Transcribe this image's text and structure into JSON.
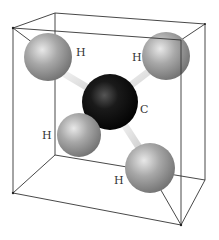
{
  "diagram": {
    "type": "molecular-structure",
    "molecule": "methane",
    "colors": {
      "hydrogen": "#9a9a9a",
      "carbon": "#111111",
      "bond": "#e6e6e6",
      "edge": "#333333",
      "background": "#ffffff"
    },
    "atoms": [
      {
        "id": "h1",
        "element": "H",
        "label": "H",
        "cx": 48,
        "cy": 57,
        "r": 24,
        "label_x": 76,
        "label_y": 56
      },
      {
        "id": "h2",
        "element": "H",
        "label": "H",
        "cx": 166,
        "cy": 56,
        "r": 24,
        "label_x": 132,
        "label_y": 61
      },
      {
        "id": "h3",
        "element": "H",
        "label": "H",
        "cx": 79,
        "cy": 135,
        "r": 22,
        "label_x": 42,
        "label_y": 139
      },
      {
        "id": "h4",
        "element": "H",
        "label": "H",
        "cx": 150,
        "cy": 168,
        "r": 25,
        "label_x": 114,
        "label_y": 184
      },
      {
        "id": "c",
        "element": "C",
        "label": "C",
        "cx": 110,
        "cy": 102,
        "r": 28,
        "label_x": 140,
        "label_y": 113
      }
    ],
    "labels": {
      "h1": "H",
      "h2": "H",
      "h3": "H",
      "h4": "H",
      "c": "C"
    }
  }
}
